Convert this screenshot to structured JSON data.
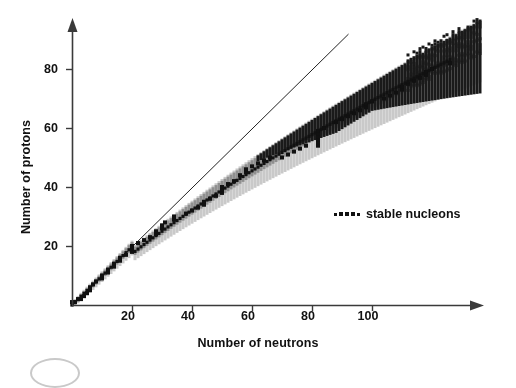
{
  "chart_data": {
    "type": "scatter",
    "title": "",
    "xlabel": "Number of neutrons",
    "ylabel": "Number of protons",
    "xlim": [
      0,
      136
    ],
    "ylim": [
      0,
      98
    ],
    "xticks": [
      20,
      40,
      60,
      80,
      100
    ],
    "yticks": [
      20,
      40,
      60,
      80
    ],
    "grid": false,
    "legend_position": "center-right",
    "series": [
      {
        "name": "stable nucleons",
        "marker": "black-square",
        "color": "#111111",
        "description": "Black squares tracing the valley of stability; N=Z at low mass, drifting to N>Z for heavy nuclei.",
        "points": [
          [
            0,
            1
          ],
          [
            1,
            1
          ],
          [
            2,
            2
          ],
          [
            3,
            2
          ],
          [
            4,
            3
          ],
          [
            5,
            4
          ],
          [
            6,
            5
          ],
          [
            6,
            6
          ],
          [
            7,
            7
          ],
          [
            8,
            8
          ],
          [
            10,
            9
          ],
          [
            10,
            10
          ],
          [
            12,
            11
          ],
          [
            12,
            12
          ],
          [
            14,
            13
          ],
          [
            14,
            14
          ],
          [
            16,
            15
          ],
          [
            16,
            16
          ],
          [
            18,
            17
          ],
          [
            20,
            18
          ],
          [
            20,
            19
          ],
          [
            20,
            20
          ],
          [
            22,
            21
          ],
          [
            24,
            22
          ],
          [
            26,
            23
          ],
          [
            28,
            24
          ],
          [
            28,
            25
          ],
          [
            30,
            26
          ],
          [
            30,
            27
          ],
          [
            31,
            28
          ],
          [
            34,
            29
          ],
          [
            34,
            30
          ],
          [
            38,
            31
          ],
          [
            40,
            32
          ],
          [
            42,
            33
          ],
          [
            44,
            34
          ],
          [
            44,
            35
          ],
          [
            46,
            36
          ],
          [
            48,
            37
          ],
          [
            50,
            38
          ],
          [
            50,
            39
          ],
          [
            50,
            40
          ],
          [
            52,
            41
          ],
          [
            54,
            42
          ],
          [
            56,
            44
          ],
          [
            58,
            45
          ],
          [
            58,
            46
          ],
          [
            60,
            47
          ],
          [
            62,
            48
          ],
          [
            64,
            49
          ],
          [
            66,
            50
          ],
          [
            70,
            50
          ],
          [
            72,
            51
          ],
          [
            74,
            52
          ],
          [
            76,
            53
          ],
          [
            78,
            54
          ],
          [
            82,
            54
          ],
          [
            82,
            55
          ],
          [
            82,
            56
          ],
          [
            82,
            57
          ],
          [
            82,
            58
          ],
          [
            82,
            59
          ],
          [
            84,
            60
          ],
          [
            88,
            62
          ],
          [
            90,
            63
          ],
          [
            92,
            64
          ],
          [
            94,
            65
          ],
          [
            96,
            66
          ],
          [
            98,
            67
          ],
          [
            98,
            68
          ],
          [
            100,
            69
          ],
          [
            104,
            70
          ],
          [
            106,
            71
          ],
          [
            108,
            72
          ],
          [
            110,
            73
          ],
          [
            110,
            74
          ],
          [
            112,
            75
          ],
          [
            114,
            76
          ],
          [
            116,
            77
          ],
          [
            118,
            78
          ],
          [
            118,
            79
          ],
          [
            120,
            80
          ],
          [
            126,
            82
          ]
        ]
      },
      {
        "name": "known radioactive nuclides (inner band)",
        "marker": "square",
        "color": "#8f8f8f",
        "description": "Medium-grey band of shorter-lived nuclides hugging the stability line on the proton-rich side."
      },
      {
        "name": "known nuclides (outer band)",
        "marker": "square",
        "color": "#c9c9c9",
        "description": "Light-grey envelope of all measured nuclides out to the drip lines."
      },
      {
        "name": "heavy neutron-rich region",
        "marker": "square",
        "color": "#1a1a1a",
        "description": "Dense black cluster of heavy nuclides above N~65, Z~58 continuing to the top-right corner."
      }
    ],
    "reference_line": {
      "name": "N = Z line",
      "from": [
        0,
        0
      ],
      "to": [
        92,
        92
      ],
      "color": "#222222",
      "width": 1
    }
  },
  "axes": {
    "x": {
      "label": "Number of neutrons",
      "ticks": [
        "20",
        "40",
        "60",
        "80",
        "100"
      ],
      "arrow": true
    },
    "y": {
      "label": "Number of protons",
      "ticks": [
        "20",
        "40",
        "60",
        "80"
      ],
      "arrow": true
    }
  },
  "legend": {
    "label": "stable nucleons",
    "marker": "dotted-square-row"
  },
  "colors": {
    "axis": "#3a3a3a",
    "text": "#111111",
    "stable": "#111111",
    "band_inner": "#8f8f8f",
    "band_outer": "#c9c9c9",
    "band_heavy": "#1a1a1a",
    "background": "#ffffff",
    "corner_mark": "#c9c9c9"
  }
}
